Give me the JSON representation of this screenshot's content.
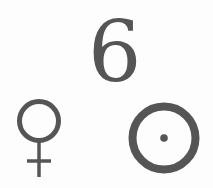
{
  "symbols": {
    "numeral": {
      "text": "6",
      "color": "#555555"
    },
    "venus": {
      "name": "venus-symbol",
      "unicode": "♀",
      "color": "#555555"
    },
    "sun": {
      "name": "sun-circumpunct-symbol",
      "unicode": "☉",
      "color": "#555555"
    }
  },
  "background": "#fdfdfd"
}
